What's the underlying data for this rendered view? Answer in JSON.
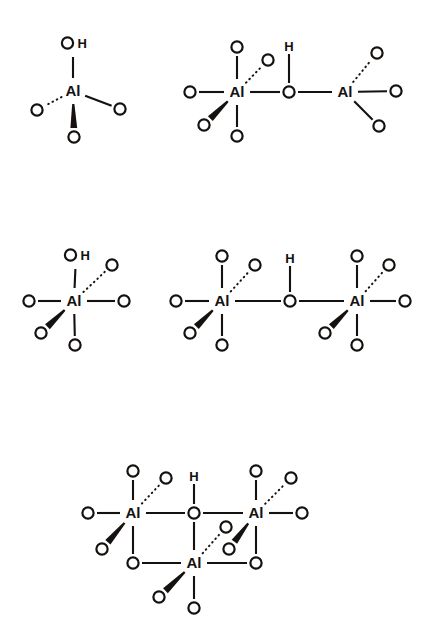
{
  "figure": {
    "background_color": "#ffffff",
    "ink_color": "#14110f",
    "bond_styles": {
      "plain": "solid line bond",
      "wedge": "bold filled wedge bond (toward viewer)",
      "hash": "dotted / hashed bond (away from viewer)"
    },
    "atom_labels": {
      "aluminium": "Al",
      "oxygen": "O",
      "hydrogen": "H",
      "hydroxyl": "OH"
    }
  },
  "structures": [
    {
      "id": "structure-1",
      "name": "mononuclear-tetrahedral-al",
      "position": "top-left",
      "centers": [
        {
          "label": "Al",
          "x": 73,
          "y": 91,
          "substituents": [
            {
              "label": "OH",
              "x": 73,
              "y": 43,
              "bond": "plain",
              "direction": "up"
            },
            {
              "label": "O",
              "x": 37,
              "y": 110,
              "bond": "hash",
              "direction": "down-left"
            },
            {
              "label": "O",
              "x": 120,
              "y": 109,
              "bond": "plain",
              "direction": "down-right"
            },
            {
              "label": "O",
              "x": 74,
              "y": 137,
              "bond": "wedge",
              "direction": "down"
            }
          ]
        }
      ]
    },
    {
      "id": "structure-2",
      "name": "dinuclear-hydroxo-bridged-al",
      "position": "top-right",
      "bridge": {
        "label": "O",
        "x": 289,
        "y": 92,
        "hydrogen": {
          "label": "H",
          "x": 289,
          "y": 46
        }
      },
      "centers": [
        {
          "label": "Al",
          "x": 237,
          "y": 92,
          "substituents": [
            {
              "label": "O",
              "x": 237,
              "y": 47,
              "bond": "plain",
              "direction": "up"
            },
            {
              "label": "O",
              "x": 268,
              "y": 60,
              "bond": "hash",
              "direction": "up-right"
            },
            {
              "label": "O",
              "x": 190,
              "y": 92,
              "bond": "plain",
              "direction": "left"
            },
            {
              "label": "O",
              "x": 204,
              "y": 125,
              "bond": "wedge",
              "direction": "down-left"
            },
            {
              "label": "O",
              "x": 237,
              "y": 136,
              "bond": "plain",
              "direction": "down"
            }
          ]
        },
        {
          "label": "Al",
          "x": 345,
          "y": 92,
          "substituents": [
            {
              "label": "O",
              "x": 377,
              "y": 53,
              "bond": "hash",
              "direction": "up-right"
            },
            {
              "label": "O",
              "x": 396,
              "y": 91,
              "bond": "plain",
              "direction": "right"
            },
            {
              "label": "O",
              "x": 379,
              "y": 126,
              "bond": "plain",
              "direction": "down-right"
            }
          ]
        }
      ]
    },
    {
      "id": "structure-3",
      "name": "mononuclear-octahedral-al-hydroxide",
      "position": "middle-left",
      "centers": [
        {
          "label": "Al",
          "x": 74,
          "y": 301,
          "substituents": [
            {
              "label": "OH",
              "x": 76,
              "y": 255,
              "bond": "plain",
              "direction": "up"
            },
            {
              "label": "O",
              "x": 112,
              "y": 265,
              "bond": "hash",
              "direction": "up-right"
            },
            {
              "label": "O",
              "x": 29,
              "y": 301,
              "bond": "plain",
              "direction": "left"
            },
            {
              "label": "O",
              "x": 124,
              "y": 301,
              "bond": "plain",
              "direction": "right"
            },
            {
              "label": "O",
              "x": 41,
              "y": 333,
              "bond": "wedge",
              "direction": "down-left"
            },
            {
              "label": "O",
              "x": 75,
              "y": 345,
              "bond": "plain",
              "direction": "down"
            }
          ]
        }
      ]
    },
    {
      "id": "structure-4",
      "name": "dinuclear-octahedral-hydroxo-bridged-al",
      "position": "middle-right",
      "bridge": {
        "label": "O",
        "x": 290,
        "y": 301,
        "hydrogen": {
          "label": "H",
          "x": 290,
          "y": 258
        }
      },
      "centers": [
        {
          "label": "Al",
          "x": 222,
          "y": 301,
          "substituents": [
            {
              "label": "O",
              "x": 222,
              "y": 256,
              "bond": "plain",
              "direction": "up"
            },
            {
              "label": "O",
              "x": 255,
              "y": 265,
              "bond": "hash",
              "direction": "up-right"
            },
            {
              "label": "O",
              "x": 176,
              "y": 301,
              "bond": "plain",
              "direction": "left"
            },
            {
              "label": "O",
              "x": 190,
              "y": 333,
              "bond": "wedge",
              "direction": "down-left"
            },
            {
              "label": "O",
              "x": 222,
              "y": 345,
              "bond": "plain",
              "direction": "down"
            }
          ]
        },
        {
          "label": "Al",
          "x": 357,
          "y": 301,
          "substituents": [
            {
              "label": "O",
              "x": 357,
              "y": 256,
              "bond": "plain",
              "direction": "up"
            },
            {
              "label": "O",
              "x": 389,
              "y": 265,
              "bond": "hash",
              "direction": "up-right"
            },
            {
              "label": "O",
              "x": 405,
              "y": 301,
              "bond": "plain",
              "direction": "right"
            },
            {
              "label": "O",
              "x": 325,
              "y": 333,
              "bond": "wedge",
              "direction": "down-left"
            },
            {
              "label": "O",
              "x": 357,
              "y": 345,
              "bond": "plain",
              "direction": "down"
            }
          ]
        }
      ]
    },
    {
      "id": "structure-5",
      "name": "trinuclear-oxo-bridged-al-cluster",
      "position": "bottom-center",
      "bridge": {
        "label": "O",
        "x": 194,
        "y": 513,
        "hydrogen": {
          "label": "H",
          "x": 194,
          "y": 476
        }
      },
      "ring_bridges": [
        {
          "label": "O",
          "x": 133,
          "y": 563,
          "between": [
            "al-left",
            "al-bottom"
          ]
        },
        {
          "label": "O",
          "x": 256,
          "y": 563,
          "between": [
            "al-right",
            "al-bottom"
          ]
        }
      ],
      "centers": [
        {
          "label": "Al",
          "id": "al-left",
          "x": 133,
          "y": 513,
          "substituents": [
            {
              "label": "O",
              "x": 133,
              "y": 471,
              "bond": "plain",
              "direction": "up"
            },
            {
              "label": "O",
              "x": 166,
              "y": 478,
              "bond": "hash",
              "direction": "up-right"
            },
            {
              "label": "O",
              "x": 88,
              "y": 513,
              "bond": "plain",
              "direction": "left"
            },
            {
              "label": "O",
              "x": 102,
              "y": 549,
              "bond": "wedge",
              "direction": "down-left"
            }
          ]
        },
        {
          "label": "Al",
          "id": "al-right",
          "x": 256,
          "y": 513,
          "substituents": [
            {
              "label": "O",
              "x": 256,
              "y": 471,
              "bond": "plain",
              "direction": "up"
            },
            {
              "label": "O",
              "x": 291,
              "y": 478,
              "bond": "hash",
              "direction": "up-right"
            },
            {
              "label": "O",
              "x": 302,
              "y": 513,
              "bond": "plain",
              "direction": "right"
            },
            {
              "label": "O",
              "x": 229,
              "y": 549,
              "bond": "wedge",
              "direction": "down-left"
            }
          ]
        },
        {
          "label": "Al",
          "id": "al-bottom",
          "x": 194,
          "y": 563,
          "substituents": [
            {
              "label": "O",
              "x": 226,
              "y": 527,
              "bond": "hash",
              "direction": "up-right"
            },
            {
              "label": "O",
              "x": 159,
              "y": 597,
              "bond": "wedge",
              "direction": "down-left"
            },
            {
              "label": "O",
              "x": 194,
              "y": 608,
              "bond": "plain",
              "direction": "down"
            }
          ]
        }
      ]
    }
  ]
}
